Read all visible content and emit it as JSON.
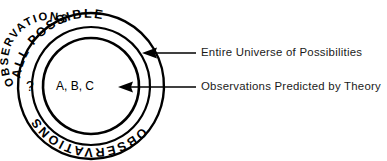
{
  "diagram": {
    "type": "concentric-venn",
    "outer_ring": {
      "text_top": "ALL POSSIBLE",
      "text_bottom": "OBSERVATIONS",
      "marker": "?"
    },
    "inner_circle": {
      "ring_text": "OBSERVATIONS",
      "center_text": "A, B, C"
    },
    "callouts": [
      {
        "label": "Entire Universe of Possibilities",
        "target": "outer-ring"
      },
      {
        "label": "Observations Predicted by Theory",
        "target": "inner-circle"
      }
    ],
    "colors": {
      "stroke": "#000000",
      "background": "#ffffff",
      "text": "#1a1a1a"
    }
  }
}
